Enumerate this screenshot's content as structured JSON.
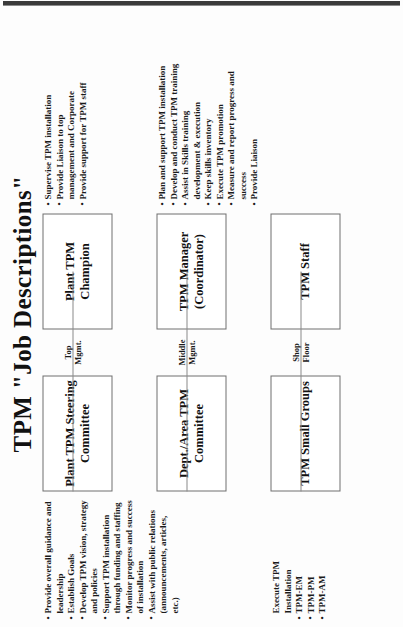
{
  "document": {
    "title": "TPM \"Job Descriptions\"",
    "orientation": "rotated-90-ccw",
    "accent_color": "#1a1a1a",
    "box_border_color": "#6e6e6e",
    "connector_color": "#8a8a8a"
  },
  "tiers": [
    {
      "id": "top",
      "level_label": "Top\nMgmt.",
      "left_node": "Plant TPM\nSteering\nCommittee",
      "right_node": "Plant TPM\nChampion",
      "left_bullets": [
        "Provide overall guidance and leadership",
        "Establish Goals",
        "Develop TPM vision, strategy and policies",
        "Support TPM installation through funding and staffing",
        "Monitor progress and success of installation",
        "Assist with public relations (announcements, articles, etc.)"
      ],
      "right_bullets": [
        "Supervise TPM installation",
        "Provide Liaison to top management and Corporate",
        "Provide support for TPM staff"
      ]
    },
    {
      "id": "middle",
      "level_label": "Middle\nMgmt.",
      "left_node": "Dept./Area\nTPM Committee",
      "right_node": "TPM\nManager\n(Coordinator)",
      "left_bullets": [],
      "right_bullets": [
        "Plan and support TPM installation",
        "Develop and conduct TPM training",
        "Assist in Skills training development & execution",
        "Keep skills inventory",
        "Execute TPM promotion",
        "Measure and report progress and success",
        "Provide Liaison"
      ]
    },
    {
      "id": "shop",
      "level_label": "Shop\nFloor",
      "left_node": "TPM\nSmall Groups",
      "right_node": "TPM\nStaff",
      "left_lead": "Execute TPM\nInstallation",
      "left_bullets": [
        "TPM-EM",
        "TPM-PM",
        "TPM-AM"
      ],
      "right_bullets": []
    }
  ]
}
